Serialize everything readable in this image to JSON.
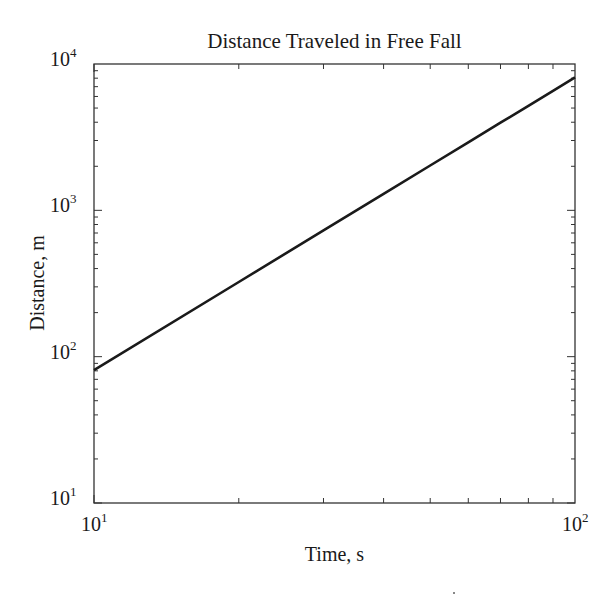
{
  "chart_data": {
    "type": "line",
    "title": "Distance Traveled in Free Fall",
    "xlabel": "Time, s",
    "ylabel": "Distance, m",
    "xscale": "log",
    "yscale": "log",
    "xlim": [
      10,
      100
    ],
    "ylim": [
      10,
      10000
    ],
    "grid": false,
    "legend": null,
    "x_ticks": [
      {
        "base": "10",
        "exp": "1",
        "value": 10
      },
      {
        "base": "10",
        "exp": "2",
        "value": 100
      }
    ],
    "y_ticks": [
      {
        "base": "10",
        "exp": "1",
        "value": 10
      },
      {
        "base": "10",
        "exp": "2",
        "value": 100
      },
      {
        "base": "10",
        "exp": "3",
        "value": 1000
      },
      {
        "base": "10",
        "exp": "4",
        "value": 10000
      }
    ],
    "series": [
      {
        "name": "distance",
        "color": "#1a1a1a",
        "x": [
          10,
          20,
          30,
          40,
          50,
          60,
          70,
          80,
          90,
          100
        ],
        "y": [
          81,
          324,
          729,
          1296,
          2025,
          2916,
          3969,
          5184,
          6561,
          8100
        ]
      }
    ]
  }
}
